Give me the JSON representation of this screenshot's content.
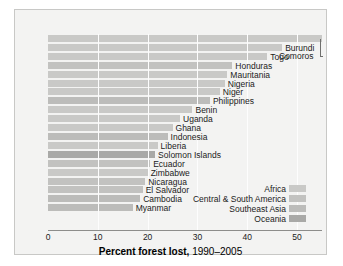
{
  "chart_data": {
    "type": "bar",
    "orientation": "horizontal",
    "title": "Percent forest lost, 1990–2005",
    "title_bold_part": "Percent forest lost,",
    "title_light_part": "1990–2005",
    "xlabel": "Percent forest lost, 1990–2005",
    "ylabel": "",
    "xlim": [
      0,
      55
    ],
    "xticks": [
      0,
      10,
      20,
      30,
      40,
      50
    ],
    "xticklabels": [
      "0",
      "10",
      "20",
      "30",
      "40",
      "50"
    ],
    "grid": "vertical-white",
    "legend_position": "bottom-right",
    "categories": [
      "Comoros",
      "Burundi",
      "Togo",
      "Honduras",
      "Mauritania",
      "Nigeria",
      "Niger",
      "Philippines",
      "Benin",
      "Uganda",
      "Ghana",
      "Indonesia",
      "Liberia",
      "Solomon Islands",
      "Ecuador",
      "Zimbabwe",
      "Nicaragua",
      "El Salvador",
      "Cambodia",
      "Myanmar"
    ],
    "values": [
      55.0,
      47.0,
      44.0,
      37.0,
      36.0,
      35.5,
      34.5,
      32.5,
      29.0,
      26.5,
      25.0,
      24.0,
      22.0,
      21.5,
      20.5,
      20.0,
      19.5,
      19.0,
      18.5,
      17.0
    ],
    "regions": [
      "Africa",
      "Africa",
      "Africa",
      "Central & South America",
      "Africa",
      "Africa",
      "Africa",
      "Southeast Asia",
      "Africa",
      "Africa",
      "Africa",
      "Southeast Asia",
      "Africa",
      "Oceania",
      "Central & South America",
      "Africa",
      "Central & South America",
      "Central & South America",
      "Southeast Asia",
      "Southeast Asia"
    ],
    "legend": [
      {
        "label": "Africa",
        "color": "#c9c9c7",
        "key": "africa"
      },
      {
        "label": "Central & South America",
        "color": "#c2c2c0",
        "key": "csa"
      },
      {
        "label": "Southeast Asia",
        "color": "#bcbcba",
        "key": "sea"
      },
      {
        "label": "Oceania",
        "color": "#a9a9a7",
        "key": "oceania"
      }
    ],
    "callout_label": "Comoros",
    "colors": {
      "bar_default": "#c4c4c2",
      "background": "#f3f3f2",
      "frame_border": "#c8c8c6",
      "gridline": "#fdfdfd",
      "axis": "#8d8d8b",
      "text": "#1b1b1b"
    }
  }
}
